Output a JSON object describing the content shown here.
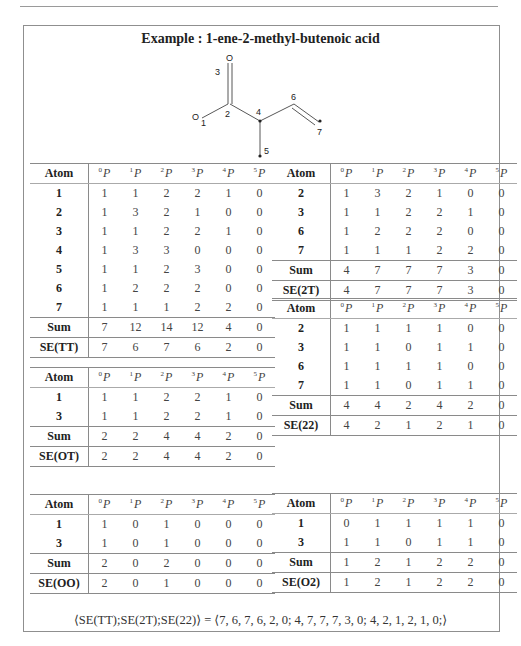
{
  "title": "Example : 1-ene-2-methyl-butenoic acid",
  "molecule": {
    "atoms": [
      {
        "id": "1",
        "symbol": "O",
        "label": "1"
      },
      {
        "id": "2",
        "symbol": "",
        "label": "2"
      },
      {
        "id": "3",
        "symbol": "O",
        "label": "3"
      },
      {
        "id": "4",
        "symbol": "",
        "label": "4"
      },
      {
        "id": "5",
        "symbol": "",
        "label": "5"
      },
      {
        "id": "6",
        "symbol": "",
        "label": "6"
      },
      {
        "id": "7",
        "symbol": "",
        "label": "7"
      }
    ],
    "labels": {
      "o1": "O",
      "n1": "1",
      "o3": "O",
      "n3": "3",
      "n2": "2",
      "n4": "4",
      "n5": "5",
      "n6": "6",
      "n7": "7"
    }
  },
  "header": {
    "atom": "Atom",
    "p": "P",
    "cols": [
      "0",
      "1",
      "2",
      "3",
      "4",
      "5"
    ]
  },
  "tables": {
    "tt": {
      "rows": [
        {
          "atom": "1",
          "v": [
            "1",
            "1",
            "2",
            "2",
            "1",
            "0"
          ]
        },
        {
          "atom": "2",
          "v": [
            "1",
            "3",
            "2",
            "1",
            "0",
            "0"
          ]
        },
        {
          "atom": "3",
          "v": [
            "1",
            "1",
            "2",
            "2",
            "1",
            "0"
          ]
        },
        {
          "atom": "4",
          "v": [
            "1",
            "3",
            "3",
            "0",
            "0",
            "0"
          ]
        },
        {
          "atom": "5",
          "v": [
            "1",
            "1",
            "2",
            "3",
            "0",
            "0"
          ]
        },
        {
          "atom": "6",
          "v": [
            "1",
            "2",
            "2",
            "2",
            "0",
            "0"
          ]
        },
        {
          "atom": "7",
          "v": [
            "1",
            "1",
            "1",
            "2",
            "2",
            "0"
          ]
        }
      ],
      "sum": {
        "label": "Sum",
        "v": [
          "7",
          "12",
          "14",
          "12",
          "4",
          "0"
        ]
      },
      "se": {
        "label": "SE(TT)",
        "v": [
          "7",
          "6",
          "7",
          "6",
          "2",
          "0"
        ]
      }
    },
    "t2t": {
      "rows": [
        {
          "atom": "2",
          "v": [
            "1",
            "3",
            "2",
            "1",
            "0",
            "0"
          ]
        },
        {
          "atom": "3",
          "v": [
            "1",
            "1",
            "2",
            "2",
            "1",
            "0"
          ]
        },
        {
          "atom": "6",
          "v": [
            "1",
            "2",
            "2",
            "2",
            "0",
            "0"
          ]
        },
        {
          "atom": "7",
          "v": [
            "1",
            "1",
            "1",
            "2",
            "2",
            "0"
          ]
        }
      ],
      "sum": {
        "label": "Sum",
        "v": [
          "4",
          "7",
          "7",
          "7",
          "3",
          "0"
        ]
      },
      "se": {
        "label": "SE(2T)",
        "v": [
          "4",
          "7",
          "7",
          "7",
          "3",
          "0"
        ]
      }
    },
    "ot": {
      "rows": [
        {
          "atom": "1",
          "v": [
            "1",
            "1",
            "2",
            "2",
            "1",
            "0"
          ]
        },
        {
          "atom": "3",
          "v": [
            "1",
            "1",
            "2",
            "2",
            "1",
            "0"
          ]
        }
      ],
      "sum": {
        "label": "Sum",
        "v": [
          "2",
          "2",
          "4",
          "4",
          "2",
          "0"
        ]
      },
      "se": {
        "label": "SE(OT)",
        "v": [
          "2",
          "2",
          "4",
          "4",
          "2",
          "0"
        ]
      }
    },
    "t22": {
      "rows": [
        {
          "atom": "2",
          "v": [
            "1",
            "1",
            "1",
            "1",
            "0",
            "0"
          ]
        },
        {
          "atom": "3",
          "v": [
            "1",
            "1",
            "0",
            "1",
            "1",
            "0"
          ]
        },
        {
          "atom": "6",
          "v": [
            "1",
            "1",
            "1",
            "1",
            "0",
            "0"
          ]
        },
        {
          "atom": "7",
          "v": [
            "1",
            "1",
            "0",
            "1",
            "1",
            "0"
          ]
        }
      ],
      "sum": {
        "label": "Sum",
        "v": [
          "4",
          "4",
          "2",
          "4",
          "2",
          "0"
        ]
      },
      "se": {
        "label": "SE(22)",
        "v": [
          "4",
          "2",
          "1",
          "2",
          "1",
          "0"
        ]
      }
    },
    "oo": {
      "rows": [
        {
          "atom": "1",
          "v": [
            "1",
            "0",
            "1",
            "0",
            "0",
            "0"
          ]
        },
        {
          "atom": "3",
          "v": [
            "1",
            "0",
            "1",
            "0",
            "0",
            "0"
          ]
        }
      ],
      "sum": {
        "label": "Sum",
        "v": [
          "2",
          "0",
          "2",
          "0",
          "0",
          "0"
        ]
      },
      "se": {
        "label": "SE(OO)",
        "v": [
          "2",
          "0",
          "1",
          "0",
          "0",
          "0"
        ]
      }
    },
    "o2": {
      "rows": [
        {
          "atom": "1",
          "v": [
            "0",
            "1",
            "1",
            "1",
            "1",
            "0"
          ]
        },
        {
          "atom": "3",
          "v": [
            "1",
            "1",
            "0",
            "1",
            "1",
            "0"
          ]
        }
      ],
      "sum": {
        "label": "Sum",
        "v": [
          "1",
          "2",
          "1",
          "2",
          "2",
          "0"
        ]
      },
      "se": {
        "label": "SE(O2)",
        "v": [
          "1",
          "2",
          "1",
          "2",
          "2",
          "0"
        ]
      }
    }
  },
  "formula": "⟨SE(TT);SE(2T);SE(22)⟩ = ⟨7, 6, 7, 6, 2, 0; 4, 7, 7, 7, 3, 0; 4, 2, 1, 2, 1, 0;⟩"
}
